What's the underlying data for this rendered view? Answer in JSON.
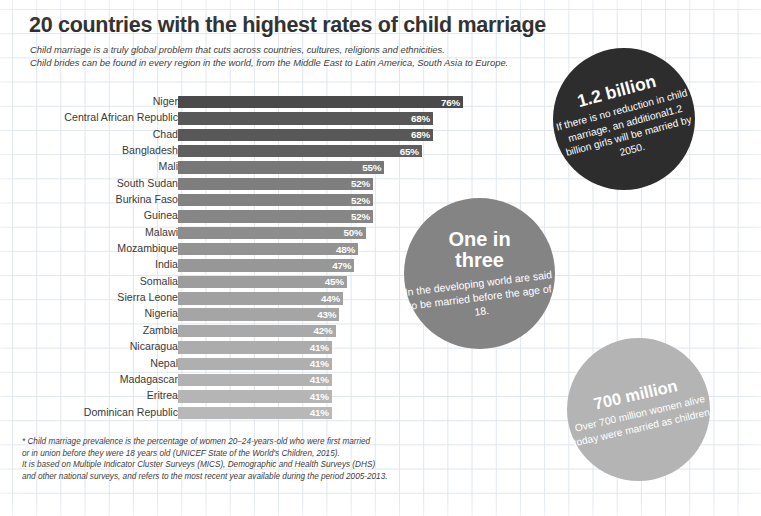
{
  "header": {
    "title": "20 countries with the highest rates of child marriage",
    "subtitle_line1": "Child marriage is a truly global problem that cuts across countries,  cultures, religions and ethnicities.",
    "subtitle_line2": "Child brides can be found in every region in the world, from the Middle East to Latin America, South Asia to Europe."
  },
  "chart_data": {
    "type": "bar",
    "orientation": "horizontal",
    "title": "20 countries with the highest rates of child marriage",
    "xlabel": "",
    "ylabel": "",
    "xlim": [
      0,
      80
    ],
    "grid": true,
    "legend": "none",
    "value_suffix": "%",
    "categories": [
      "Niger",
      "Central African Republic",
      "Chad",
      "Bangladesh",
      "Mali",
      "South Sudan",
      "Burkina Faso",
      "Guinea",
      "Malawi",
      "Mozambique",
      "India",
      "Somalia",
      "Sierra Leone",
      "Nigeria",
      "Zambia",
      "Nicaragua",
      "Nepal",
      "Madagascar",
      "Eritrea",
      "Dominican Republic"
    ],
    "values": [
      76,
      68,
      68,
      65,
      55,
      52,
      52,
      52,
      50,
      48,
      47,
      45,
      44,
      43,
      42,
      41,
      41,
      41,
      41,
      41
    ],
    "labels": [
      "76%",
      "68%",
      "68%",
      "65%",
      "55%",
      "52%",
      "52%",
      "52%",
      "50%",
      "48%",
      "47%",
      "45%",
      "44%",
      "43%",
      "42%",
      "41%",
      "41%",
      "41%",
      "41%",
      "41%"
    ],
    "bar_colors": [
      "#4a4a4a",
      "#585858",
      "#585858",
      "#5f5f5f",
      "#777777",
      "#7e7e7e",
      "#828282",
      "#868686",
      "#8d8d8d",
      "#939393",
      "#979797",
      "#9d9d9d",
      "#a1a1a1",
      "#a5a5a5",
      "#a9a9a9",
      "#acacac",
      "#afafaf",
      "#b2b2b2",
      "#b5b5b5",
      "#b8b8b8"
    ]
  },
  "callouts": {
    "dark": {
      "headline": "1.2 billion",
      "body": "If there is no reduction in child marriage, an additional1.2 billion girls will be married by 2050.",
      "color": "#2d2d2d"
    },
    "mid": {
      "headline_line1": "One in",
      "headline_line2": "three",
      "body": "In the developing world are said to be married before the age of 18.",
      "color": "#848484"
    },
    "light": {
      "headline": "700 million",
      "body": "Over 700 million women alive today were married as children.",
      "color": "#b4b4b4"
    }
  },
  "footnote": {
    "line1": "* Child marriage prevalence is the percentage of women 20–24-years-old who were first married",
    "line2": "or in union before they were 18 years old (UNICEF State of the World's Children, 2015).",
    "line3": "It is based on Multiple Indicator Cluster Surveys (MICS), Demographic and Health Surveys (DHS)",
    "line4": "and other national surveys, and refers to the most recent year available during the period 2005-2013."
  }
}
